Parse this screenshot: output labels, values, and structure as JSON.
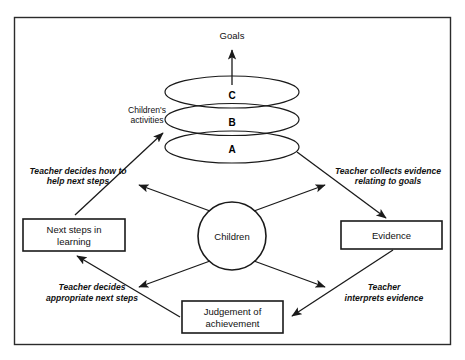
{
  "diagram": {
    "title_text": "Goals",
    "frame": {
      "name": "outer-frame"
    },
    "goal": {
      "label": "Goals"
    },
    "progression_ellipses": [
      {
        "label": "C",
        "name": "ellipse-c"
      },
      {
        "label": "B",
        "name": "ellipse-b"
      },
      {
        "label": "A",
        "name": "ellipse-a"
      }
    ],
    "children_activities_label": {
      "line1": "Children's",
      "line2": "activities"
    },
    "center_node": {
      "label": "Children"
    },
    "boxes": [
      {
        "name": "next-steps-box",
        "line1": "Next steps in",
        "line2": "learning"
      },
      {
        "name": "evidence-box",
        "line1": "Evidence",
        "line2": ""
      },
      {
        "name": "judgement-box",
        "line1": "Judgement of",
        "line2": "achievement"
      }
    ],
    "annotations": [
      {
        "name": "annotation-teacher-decides-help",
        "line1": "Teacher decides how to",
        "line2": "help next steps"
      },
      {
        "name": "annotation-teacher-collects-evidence",
        "line1": "Teacher collects evidence",
        "line2": "relating to goals"
      },
      {
        "name": "annotation-teacher-decides-next-steps",
        "line1": "Teacher decides",
        "line2": "appropriate next steps"
      },
      {
        "name": "annotation-teacher-interprets-evidence",
        "line1": "Teacher",
        "line2": "interprets evidence"
      }
    ],
    "colors": {
      "stroke": "#1a1a1a",
      "frame": "#2b2b2b",
      "background": "#ffffff",
      "text": "#111111"
    }
  }
}
